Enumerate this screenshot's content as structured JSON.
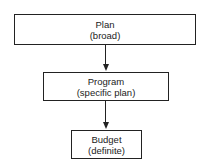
{
  "diagram": {
    "nodes": [
      {
        "id": "plan",
        "title": "Plan",
        "subtitle": "(broad)"
      },
      {
        "id": "program",
        "title": "Program",
        "subtitle": "(specific plan)"
      },
      {
        "id": "budget",
        "title": "Budget",
        "subtitle": "(definite)"
      }
    ],
    "edges": [
      {
        "from": "plan",
        "to": "program"
      },
      {
        "from": "program",
        "to": "budget"
      }
    ]
  }
}
